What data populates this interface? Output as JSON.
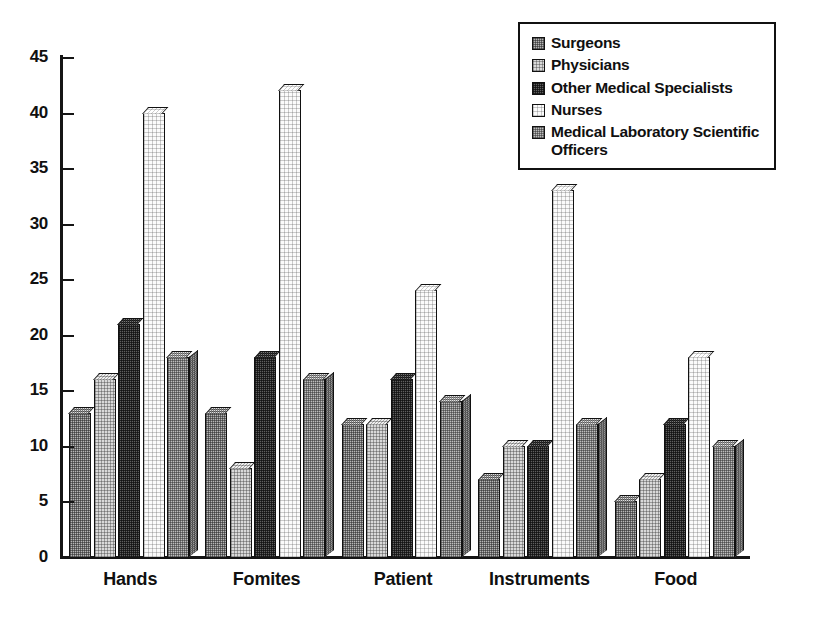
{
  "chart_data": {
    "type": "bar",
    "title": "",
    "subtitle": "",
    "xlabel": "",
    "ylabel": "",
    "ylim": [
      0,
      45
    ],
    "ytick_interval": 5,
    "yticks": [
      0,
      5,
      10,
      15,
      20,
      25,
      30,
      35,
      40,
      45
    ],
    "grid": false,
    "legend_position": "top-right",
    "categories": [
      "Hands",
      "Fomites",
      "Patient",
      "Instruments",
      "Food"
    ],
    "series": [
      {
        "name": "Surgeons",
        "values": [
          13,
          13,
          12,
          7,
          5
        ],
        "swatch": "checker-medium",
        "color": "#b6b6b6"
      },
      {
        "name": "Physicians",
        "values": [
          16,
          8,
          12,
          10,
          7
        ],
        "swatch": "checker-light",
        "color": "#d9d9d9"
      },
      {
        "name": "Other Medical Specialists",
        "values": [
          21,
          18,
          16,
          10,
          12
        ],
        "swatch": "checker-dark",
        "color": "#5f5f5f"
      },
      {
        "name": "Nurses",
        "values": [
          40,
          42,
          24,
          33,
          18
        ],
        "swatch": "empty-white",
        "color": "#fbfbfb"
      },
      {
        "name": "Medical Laboratory Scientific Officers",
        "values": [
          18,
          16,
          14,
          12,
          10
        ],
        "swatch": "checker-medium",
        "color": "#bdbdbd"
      }
    ]
  },
  "legend": {
    "entries": [
      {
        "label": "Surgeons"
      },
      {
        "label": "Physicians"
      },
      {
        "label": "Other Medical Specialists"
      },
      {
        "label": "Nurses"
      },
      {
        "label": "Medical Laboratory Scientific Officers"
      }
    ]
  },
  "axis": {
    "y_tick_labels": [
      "45",
      "40",
      "35",
      "30",
      "25",
      "20",
      "15",
      "10",
      "5",
      "0"
    ],
    "x_tick_labels": [
      "Hands",
      "Fomites",
      "Patient",
      "Instruments",
      "Food"
    ]
  }
}
